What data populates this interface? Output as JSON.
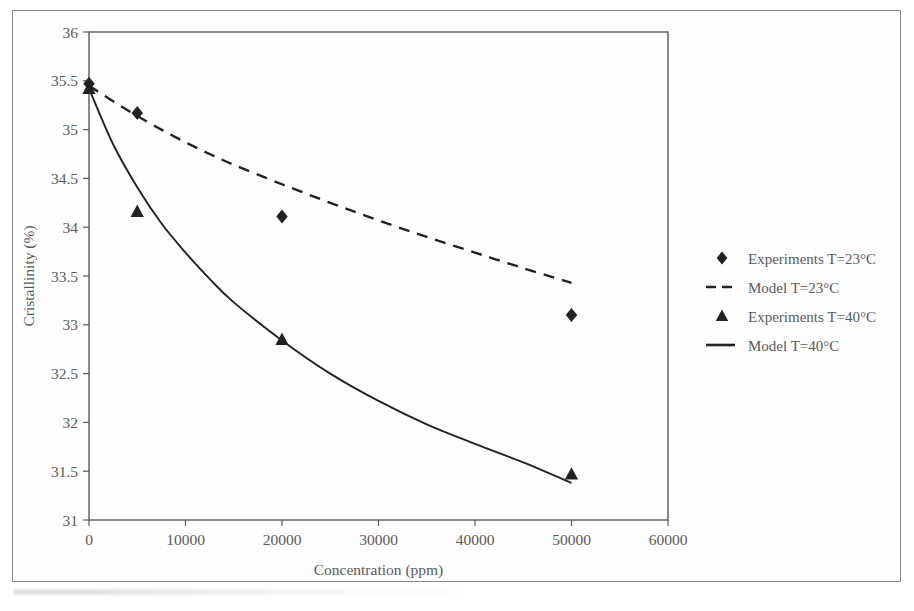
{
  "chart_data": {
    "type": "scatter",
    "title": "",
    "xlabel": "Concentration (ppm)",
    "ylabel": "Cristallinity (%)",
    "xlim": [
      0,
      60000
    ],
    "ylim": [
      31,
      36
    ],
    "xticks": [
      "0",
      "10000",
      "20000",
      "30000",
      "40000",
      "50000",
      "60000"
    ],
    "xtick_values": [
      0,
      10000,
      20000,
      30000,
      40000,
      50000,
      60000
    ],
    "yticks": [
      "31",
      "31.5",
      "32",
      "32.5",
      "33",
      "33.5",
      "34",
      "34.5",
      "35",
      "35.5",
      "36"
    ],
    "ytick_values": [
      31,
      31.5,
      32,
      32.5,
      33,
      33.5,
      34,
      34.5,
      35,
      35.5,
      36
    ],
    "grid": false,
    "legend_position": "right",
    "series": [
      {
        "name": "Experiments T=23°C",
        "kind": "markers",
        "marker": "diamond",
        "color": "#111111",
        "x": [
          0,
          5000,
          20000,
          50000
        ],
        "y": [
          35.47,
          35.17,
          34.11,
          33.1
        ]
      },
      {
        "name": "Model T=23°C",
        "kind": "line",
        "style": "dashed",
        "color": "#222222",
        "x": [
          0,
          2500,
          5000,
          7500,
          10000,
          12500,
          15000,
          20000,
          25000,
          30000,
          35000,
          40000,
          45000,
          50000
        ],
        "y": [
          35.45,
          35.29,
          35.14,
          35.0,
          34.87,
          34.75,
          34.64,
          34.44,
          34.25,
          34.07,
          33.9,
          33.74,
          33.58,
          33.43
        ]
      },
      {
        "name": "Experiments T=40°C",
        "kind": "markers",
        "marker": "triangle",
        "color": "#111111",
        "x": [
          0,
          5000,
          20000,
          50000
        ],
        "y": [
          35.42,
          34.16,
          32.85,
          31.47
        ]
      },
      {
        "name": "Model T=40°C",
        "kind": "line",
        "style": "solid",
        "color": "#222222",
        "x": [
          0,
          2500,
          5000,
          7500,
          10000,
          12500,
          15000,
          20000,
          25000,
          30000,
          35000,
          40000,
          45000,
          50000
        ],
        "y": [
          35.42,
          34.85,
          34.41,
          34.04,
          33.74,
          33.47,
          33.23,
          32.84,
          32.5,
          32.22,
          31.98,
          31.78,
          31.59,
          31.38
        ]
      }
    ]
  },
  "legend": {
    "items": [
      {
        "label": "Experiments T=23°C",
        "marker": "diamond"
      },
      {
        "label": "Model T=23°C",
        "marker": "dashed-line"
      },
      {
        "label": "Experiments T=40°C",
        "marker": "triangle"
      },
      {
        "label": "Model T=40°C",
        "marker": "solid-line"
      }
    ]
  },
  "colors": {
    "ink": "#222222",
    "axis": "#5a5a5a",
    "frame": "#8d8d8d",
    "background": "#ffffff"
  }
}
